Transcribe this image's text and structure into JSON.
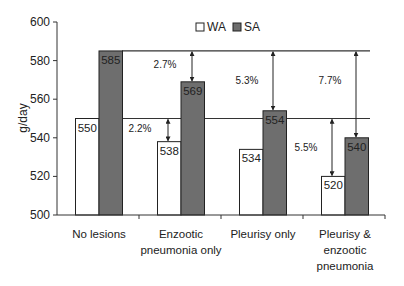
{
  "chart_data": {
    "type": "bar",
    "title": "",
    "xlabel": "",
    "ylabel": "g/day",
    "ylim": [
      500,
      600
    ],
    "yticks": [
      500,
      520,
      540,
      560,
      580,
      600
    ],
    "categories": [
      "No lesions",
      "Enzootic pneumonia only",
      "Pleurisy only",
      "Pleurisy & enzootic pneumonia"
    ],
    "category_lines": [
      [
        "No lesions"
      ],
      [
        "Enzootic",
        "pneumonia only"
      ],
      [
        "Pleurisy only"
      ],
      [
        "Pleurisy &",
        "enzootic",
        "pneumonia"
      ]
    ],
    "series": [
      {
        "name": "WA",
        "color": "#ffffff",
        "values": [
          550,
          538,
          534,
          520
        ]
      },
      {
        "name": "SA",
        "color": "#6e6e6e",
        "values": [
          585,
          569,
          554,
          540
        ]
      }
    ],
    "legend": {
      "position": "top-center",
      "entries": [
        "WA",
        "SA"
      ]
    },
    "reference_lines": [
      {
        "value": 585,
        "label": "SA no lesions"
      },
      {
        "value": 550,
        "label": "WA no lesions"
      }
    ],
    "annotations": [
      {
        "category": "Enzootic pneumonia only",
        "series": "WA",
        "text": "2.2%"
      },
      {
        "category": "Enzootic pneumonia only",
        "series": "SA",
        "text": "2.7%"
      },
      {
        "category": "Pleurisy only",
        "series": "SA",
        "text": "5.3%"
      },
      {
        "category": "Pleurisy & enzootic pneumonia",
        "series": "WA",
        "text": "5.5%"
      },
      {
        "category": "Pleurisy & enzootic pneumonia",
        "series": "SA",
        "text": "7.7%"
      }
    ],
    "grid": false
  }
}
